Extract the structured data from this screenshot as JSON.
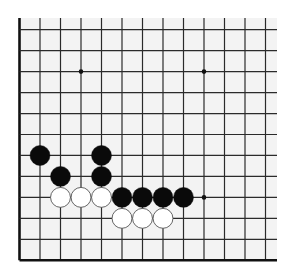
{
  "board": {
    "description": "Go board diagram, lower-left corner section (13 columns x 12 rows visible), top and right edges open",
    "columns": 13,
    "rows": 12,
    "col_x0": 19.5,
    "col_spacing": 20.5,
    "row_y0": 29.7,
    "row_spacing": 20.96,
    "line_top": 18,
    "line_right": 277,
    "colors": {
      "board_bg": "#f3f3f3",
      "page_bg": "#ffffff",
      "line": "#2a2a2a",
      "edge_line": "#111111",
      "black_stone": "#0a0a0a",
      "white_stone": "#ffffff",
      "white_stone_outline": "#555555"
    },
    "edges": [
      "left",
      "bottom"
    ],
    "star_points": [
      {
        "col": 3,
        "row": 2
      },
      {
        "col": 9,
        "row": 2
      },
      {
        "col": 9,
        "row": 8
      }
    ],
    "stones": [
      {
        "color": "black",
        "col": 1,
        "row": 6
      },
      {
        "color": "black",
        "col": 4,
        "row": 6
      },
      {
        "color": "black",
        "col": 2,
        "row": 7
      },
      {
        "color": "black",
        "col": 4,
        "row": 7
      },
      {
        "color": "white",
        "col": 2,
        "row": 8
      },
      {
        "color": "white",
        "col": 3,
        "row": 8
      },
      {
        "color": "white",
        "col": 4,
        "row": 8
      },
      {
        "color": "black",
        "col": 5,
        "row": 8
      },
      {
        "color": "black",
        "col": 6,
        "row": 8
      },
      {
        "color": "black",
        "col": 7,
        "row": 8
      },
      {
        "color": "black",
        "col": 8,
        "row": 8
      },
      {
        "color": "white",
        "col": 5,
        "row": 9
      },
      {
        "color": "white",
        "col": 6,
        "row": 9
      },
      {
        "color": "white",
        "col": 7,
        "row": 9
      }
    ]
  }
}
